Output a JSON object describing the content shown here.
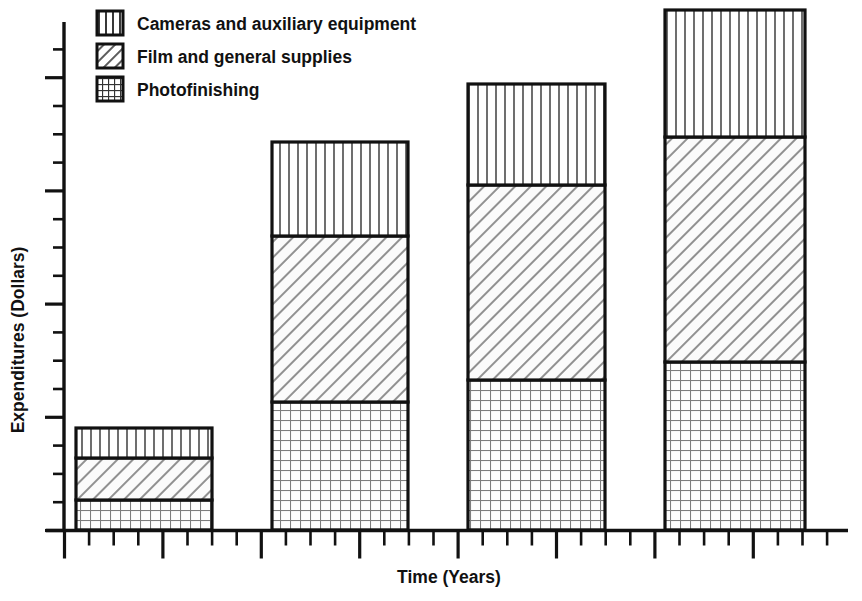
{
  "chart_data": {
    "type": "bar",
    "subtype": "stacked-bar",
    "title": "",
    "xlabel": "Time (Years)",
    "ylabel": "Expenditures (Dollars)",
    "categories": [
      "Year 1",
      "Year 2",
      "Year 3",
      "Year 4"
    ],
    "grid": false,
    "legend_position": "top-left",
    "axis_tick_labels": {
      "x": [],
      "y": []
    },
    "xlim": [
      0,
      16
    ],
    "ylim": [
      0,
      18.6
    ],
    "stack_order_bottom_to_top": [
      "Photofinishing",
      "Film and general supplies",
      "Cameras and auxiliary equipment"
    ],
    "series": [
      {
        "name": "Photofinishing",
        "pattern": "grid",
        "values": [
          1.2,
          5.1,
          6.0,
          6.7
        ]
      },
      {
        "name": "Film and general supplies",
        "pattern": "diagonal",
        "values": [
          1.7,
          6.6,
          7.8,
          9.0
        ]
      },
      {
        "name": "Cameras and auxiliary equipment",
        "pattern": "vertical",
        "values": [
          1.2,
          3.8,
          4.0,
          5.1
        ]
      }
    ],
    "totals": [
      4.1,
      15.5,
      17.8,
      20.8
    ]
  },
  "legend": {
    "items": [
      {
        "label": "Cameras and auxiliary equipment",
        "pattern": "vertical"
      },
      {
        "label": "Film and general supplies",
        "pattern": "diagonal"
      },
      {
        "label": "Photofinishing",
        "pattern": "grid"
      }
    ]
  },
  "axes": {
    "y_title": "Expenditures (Dollars)",
    "x_title": "Time (Years)"
  },
  "colors": {
    "ink": "#111111",
    "pattern_line": "#555555",
    "background": "#ffffff"
  }
}
